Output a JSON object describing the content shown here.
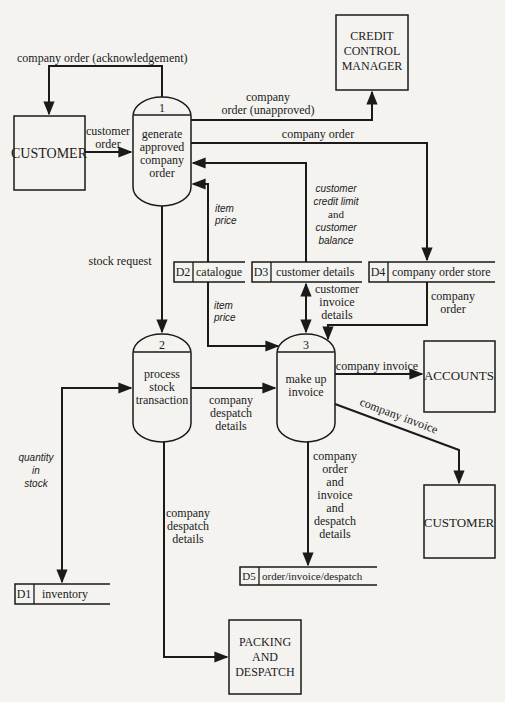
{
  "diagram": {
    "type": "data-flow-diagram",
    "external_entities": {
      "customer_left": "CUSTOMER",
      "credit_manager": [
        "CREDIT",
        "CONTROL",
        "MANAGER"
      ],
      "accounts": "ACCOUNTS",
      "customer_right": "CUSTOMER",
      "packing": [
        "PACKING",
        "AND",
        "DESPATCH"
      ]
    },
    "processes": [
      {
        "id": "1",
        "lines": [
          "generate",
          "approved",
          "company",
          "order"
        ]
      },
      {
        "id": "2",
        "lines": [
          "process",
          "stock",
          "transaction"
        ]
      },
      {
        "id": "3",
        "lines": [
          "make up",
          "invoice"
        ]
      }
    ],
    "data_stores": [
      {
        "id": "D1",
        "name": "inventory"
      },
      {
        "id": "D2",
        "name": "catalogue"
      },
      {
        "id": "D3",
        "name": "customer details"
      },
      {
        "id": "D4",
        "name": "company order store"
      },
      {
        "id": "D5",
        "name": "order/invoice/despatch"
      }
    ],
    "flows": {
      "ack": "company order (acknowledgement)",
      "customer_order": [
        "customer",
        "order"
      ],
      "unapproved": [
        "company",
        "order (unapproved)"
      ],
      "company_order_top": "company order",
      "credit": [
        "customer",
        "credit limit",
        "and",
        "customer",
        "balance"
      ],
      "item_price_up": [
        "item",
        "price"
      ],
      "stock_request": "stock request",
      "item_price_down": [
        "item",
        "price"
      ],
      "customer_invoice_details": [
        "customer",
        "invoice",
        "details"
      ],
      "company_order_d4": [
        "company",
        "order"
      ],
      "quantity_in_stock": [
        "quantity",
        "in",
        "stock"
      ],
      "despatch_details_horiz": [
        "company",
        "despatch",
        "details"
      ],
      "invoice_accounts": "company invoice",
      "invoice_customer": "company invoice",
      "order_invoice_despatch": [
        "company",
        "order",
        "and",
        "invoice",
        "and",
        "despatch",
        "details"
      ],
      "despatch_details_vert": [
        "company",
        "despatch",
        "details"
      ]
    }
  }
}
